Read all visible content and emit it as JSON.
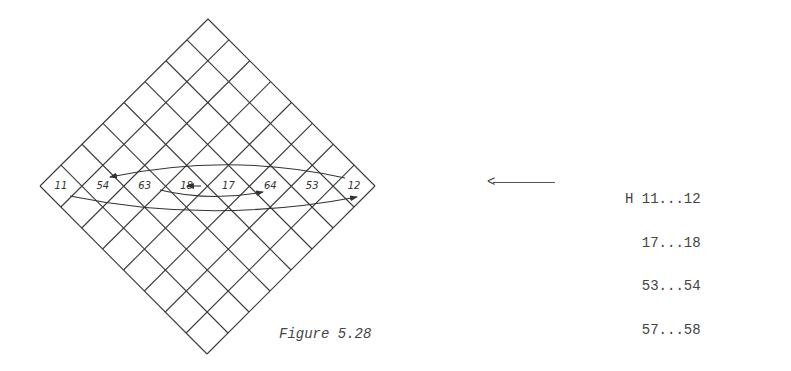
{
  "figure": {
    "caption": "Figure 5.28",
    "grid": {
      "rows": 8,
      "cols": 8,
      "orientation": "diamond (rotated 45°)",
      "middle_row_labels": [
        "11",
        "54",
        "63",
        "18",
        "17",
        "64",
        "53",
        "12"
      ]
    },
    "arrows": [
      {
        "from": "53",
        "to": "54",
        "shape": "upper arc"
      },
      {
        "from": "17",
        "to": "18",
        "shape": "straight"
      },
      {
        "from": "63",
        "to": "64",
        "shape": "lower arc"
      },
      {
        "from": "11",
        "to": "12",
        "shape": "long lower arc"
      }
    ],
    "pointer_arrow": "<",
    "h_list": {
      "prefix": "H",
      "rows": [
        "11...12",
        "17...18",
        "53...54",
        "57...58"
      ]
    }
  },
  "colors": {
    "background": "#ffffff",
    "ink": "#3a3a3a"
  }
}
